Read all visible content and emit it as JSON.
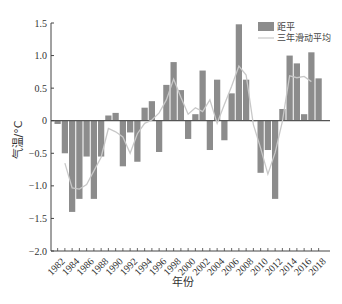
{
  "chart_data": {
    "type": "bar",
    "title": "",
    "xlabel": "年份",
    "ylabel": "气温/°C",
    "ylim": [
      -2.0,
      1.5
    ],
    "yticks": [
      1.5,
      1.0,
      0.5,
      0,
      -0.5,
      -1.0,
      -1.5,
      -2.0
    ],
    "ytick_labels": [
      "1.5",
      "1.0",
      "0.5",
      "0",
      "−0.5",
      "−1.0",
      "−1.5",
      "−2.0"
    ],
    "xtick_labels": [
      "1982",
      "1984",
      "1986",
      "1988",
      "1990",
      "1992",
      "1994",
      "1996",
      "1998",
      "2000",
      "2002",
      "2004",
      "2006",
      "2008",
      "2010",
      "2012",
      "2014",
      "2016",
      "2018"
    ],
    "grid": false,
    "legend_position": "upper right",
    "categories": [
      1982,
      1983,
      1984,
      1985,
      1986,
      1987,
      1988,
      1989,
      1990,
      1991,
      1992,
      1993,
      1994,
      1995,
      1996,
      1997,
      1998,
      1999,
      2000,
      2001,
      2002,
      2003,
      2004,
      2005,
      2006,
      2007,
      2008,
      2009,
      2010,
      2011,
      2012,
      2013,
      2014,
      2015,
      2016,
      2017,
      2018
    ],
    "series": [
      {
        "name": "距平",
        "type": "bar",
        "color": "#8c8c8c",
        "values": [
          -0.05,
          -0.5,
          -1.4,
          -1.2,
          -0.55,
          -1.2,
          -0.55,
          0.08,
          0.12,
          -0.7,
          -0.18,
          -0.63,
          0.2,
          0.3,
          -0.48,
          0.55,
          0.9,
          0.47,
          -0.28,
          0.1,
          0.77,
          -0.45,
          0.63,
          -0.3,
          0.42,
          1.48,
          0.63,
          0.0,
          -0.8,
          -0.45,
          -1.2,
          0.18,
          1.0,
          0.88,
          0.1,
          1.05,
          0.65
        ]
      },
      {
        "name": "三年滑动平均",
        "type": "line",
        "color": "#c8c8c8",
        "values": [
          null,
          -0.65,
          -1.03,
          -1.05,
          -0.98,
          -0.77,
          -0.56,
          -0.12,
          -0.17,
          -0.25,
          -0.5,
          -0.2,
          -0.04,
          0.01,
          0.12,
          0.32,
          0.64,
          0.36,
          0.1,
          0.2,
          0.14,
          0.32,
          -0.04,
          0.25,
          0.53,
          0.84,
          0.7,
          -0.06,
          -0.42,
          -0.82,
          -0.49,
          -0.01,
          0.69,
          0.66,
          0.68,
          0.6,
          null
        ]
      }
    ]
  },
  "legend": {
    "bar_label": "距平",
    "line_label": "三年滑动平均"
  }
}
